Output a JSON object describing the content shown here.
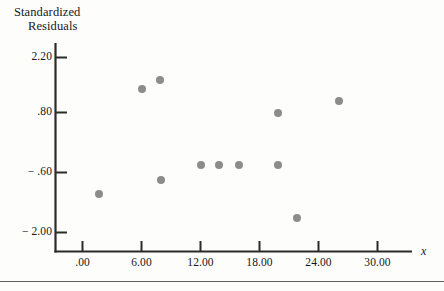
{
  "chart_data": {
    "type": "scatter",
    "title": "Standardized Residuals",
    "title_line1": "Standardized",
    "title_line2": "Residuals",
    "xlabel": "x",
    "ylabel": "Standardized Residuals",
    "xlim": [
      -2.0,
      34.0
    ],
    "ylim": [
      -2.75,
      2.75
    ],
    "grid": false,
    "legend": null,
    "marker_color": "#8c8c8c",
    "axis_color": "#2b2b2b",
    "x_ticks": [
      {
        "value": 0.0,
        "label": ".00"
      },
      {
        "value": 6.0,
        "label": "6.00"
      },
      {
        "value": 12.0,
        "label": "12.00"
      },
      {
        "value": 18.0,
        "label": "18.00"
      },
      {
        "value": 24.0,
        "label": "24.00"
      },
      {
        "value": 30.0,
        "label": "30.00"
      }
    ],
    "y_ticks": [
      {
        "value": 2.2,
        "label": "2.20"
      },
      {
        "value": 0.8,
        "label": ".80"
      },
      {
        "value": -0.6,
        "label": "− .60"
      },
      {
        "value": -2.0,
        "label": "− 2.00"
      }
    ],
    "points": [
      {
        "x": 1.7,
        "y": -1.1
      },
      {
        "x": 6.0,
        "y": 1.35
      },
      {
        "x": 7.9,
        "y": 1.55
      },
      {
        "x": 8.0,
        "y": -0.78
      },
      {
        "x": 12.0,
        "y": -0.42
      },
      {
        "x": 15.9,
        "y": -0.42
      },
      {
        "x": 19.9,
        "y": 0.8
      },
      {
        "x": 19.9,
        "y": -0.42
      },
      {
        "x": 21.8,
        "y": -1.65
      },
      {
        "x": 26.1,
        "y": 1.08
      },
      {
        "x": 13.9,
        "y": -0.42
      }
    ]
  }
}
